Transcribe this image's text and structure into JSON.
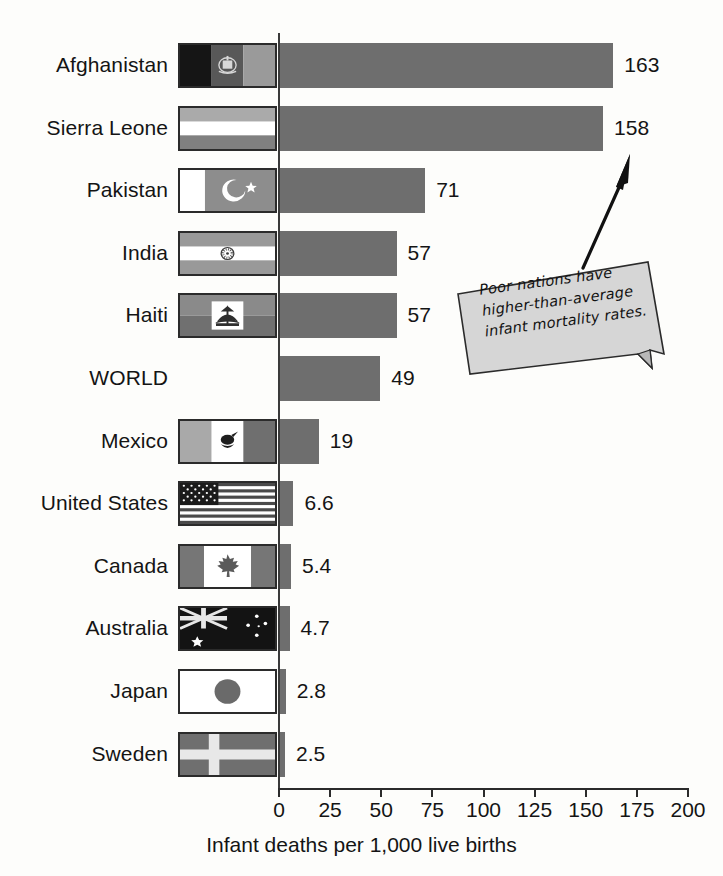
{
  "chart_data": {
    "type": "bar",
    "orientation": "horizontal",
    "title": "",
    "xlabel": "Infant deaths per 1,000 live births",
    "ylabel": "",
    "xlim": [
      0,
      200
    ],
    "xticks": [
      0,
      25,
      50,
      75,
      100,
      125,
      150,
      175,
      200
    ],
    "xtick_labels": [
      "0",
      "25",
      "50",
      "75",
      "100",
      "125",
      "150",
      "175",
      "200"
    ],
    "grid": false,
    "legend": null,
    "categories": [
      "Afghanistan",
      "Sierra Leone",
      "Pakistan",
      "India",
      "Haiti",
      "WORLD",
      "Mexico",
      "United States",
      "Canada",
      "Australia",
      "Japan",
      "Sweden"
    ],
    "values": [
      163,
      158,
      71,
      57,
      57,
      49,
      19,
      6.6,
      5.4,
      4.7,
      2.8,
      2.5
    ],
    "value_labels": [
      "163",
      "158",
      "71",
      "57",
      "57",
      "49",
      "19",
      "6.6",
      "5.4",
      "4.7",
      "2.8",
      "2.5"
    ],
    "bar_color": "#6e6e6e",
    "annotations": [
      {
        "text": "Poor nations have higher-than-average infant mortality rates.",
        "lines": [
          "Poor nations have",
          "higher-than-average",
          "infant mortality rates."
        ],
        "points_to": "Sierra Leone"
      }
    ]
  },
  "rows": [
    {
      "country": "Afghanistan",
      "value": 163,
      "label": "163",
      "flag": "afghanistan-flag"
    },
    {
      "country": "Sierra Leone",
      "value": 158,
      "label": "158",
      "flag": "sierra-leone-flag"
    },
    {
      "country": "Pakistan",
      "value": 71,
      "label": "71",
      "flag": "pakistan-flag"
    },
    {
      "country": "India",
      "value": 57,
      "label": "57",
      "flag": "india-flag"
    },
    {
      "country": "Haiti",
      "value": 57,
      "label": "57",
      "flag": "haiti-flag"
    },
    {
      "country": "WORLD",
      "value": 49,
      "label": "49",
      "flag": null
    },
    {
      "country": "Mexico",
      "value": 19,
      "label": "19",
      "flag": "mexico-flag"
    },
    {
      "country": "United States",
      "value": 6.6,
      "label": "6.6",
      "flag": "united-states-flag"
    },
    {
      "country": "Canada",
      "value": 5.4,
      "label": "5.4",
      "flag": "canada-flag"
    },
    {
      "country": "Australia",
      "value": 4.7,
      "label": "4.7",
      "flag": "australia-flag"
    },
    {
      "country": "Japan",
      "value": 2.8,
      "label": "2.8",
      "flag": "japan-flag"
    },
    {
      "country": "Sweden",
      "value": 2.5,
      "label": "2.5",
      "flag": "sweden-flag"
    }
  ],
  "axis": {
    "title": "Infant deaths per 1,000 live births",
    "ticks": [
      "0",
      "25",
      "50",
      "75",
      "100",
      "125",
      "150",
      "175",
      "200"
    ]
  },
  "callout": {
    "line1": "Poor nations have",
    "line2": "higher-than-average",
    "line3": "infant mortality rates."
  },
  "colors": {
    "bar": "#6e6e6e",
    "axis": "#2b2b2b",
    "callout_fill": "#d6d6d6",
    "text": "#141414"
  }
}
